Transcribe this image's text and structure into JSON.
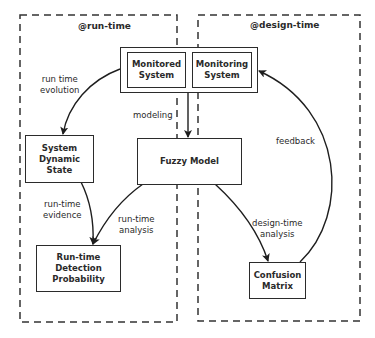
{
  "regions": {
    "run_time": {
      "title": "@run-time"
    },
    "design_time": {
      "title": "@design-time"
    }
  },
  "nodes": {
    "monitored_system": "Monitored\nSystem",
    "monitoring_system": "Monitoring\nSystem",
    "system_dynamic_state": "System\nDynamic\nState",
    "fuzzy_model": "Fuzzy Model",
    "runtime_detection_probability": "Run-time\nDetection\nProbability",
    "confusion_matrix": "Confusion\nMatrix"
  },
  "edges": {
    "run_time_evolution": "run time\nevolution",
    "modeling": "modeling",
    "run_time_evidence": "run-time\nevidence",
    "run_time_analysis": "run-time\nanalysis",
    "design_time_analysis": "design-time\nanalysis",
    "feedback": "feedback"
  },
  "colors": {
    "stroke": "#2b2b2b",
    "background": "#ffffff"
  }
}
